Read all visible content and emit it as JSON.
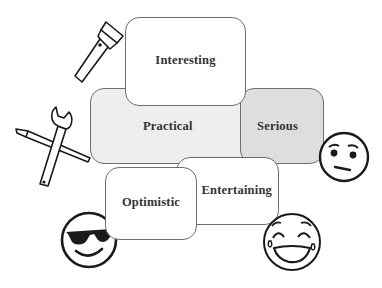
{
  "diagram": {
    "type": "overlapping-rounded-boxes",
    "boxes": [
      {
        "id": "interesting",
        "label": "Interesting",
        "fill": "#ffffff"
      },
      {
        "id": "practical",
        "label": "Practical",
        "fill": "#eeeeee"
      },
      {
        "id": "serious",
        "label": "Serious",
        "fill": "#dedede"
      },
      {
        "id": "entertaining",
        "label": "Entertaining",
        "fill": "#ffffff"
      },
      {
        "id": "optimistic",
        "label": "Optimistic",
        "fill": "#ffffff"
      }
    ],
    "icons": [
      {
        "name": "flashlight-icon",
        "near": "Interesting"
      },
      {
        "name": "wrench-screwdriver-icon",
        "near": "Practical"
      },
      {
        "name": "neutral-face-icon",
        "near": "Serious"
      },
      {
        "name": "laughing-tears-face-icon",
        "near": "Entertaining"
      },
      {
        "name": "sunglasses-face-icon",
        "near": "Optimistic"
      }
    ],
    "colors": {
      "border": "#6e6e6e",
      "text": "#333333",
      "icon_stroke": "#1a1a1a"
    }
  }
}
